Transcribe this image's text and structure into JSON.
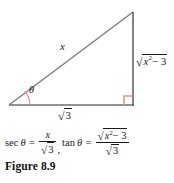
{
  "figure": {
    "caption": "Figure 8.9",
    "colors": {
      "line": "#5a5a5a",
      "hypotenuse": "#6b6b6b",
      "vertical_leg": "#4a4a4a",
      "angle_mark": "#e8908f",
      "right_angle_mark": "#e8908f",
      "text": "#1a1a1a",
      "background": "#ffffff"
    },
    "triangle": {
      "vertices": {
        "left": [
          9,
          105
        ],
        "apex": [
          133,
          12
        ],
        "right": [
          133,
          105
        ]
      },
      "angle_label": "θ",
      "hypotenuse_label": "x",
      "vertical_leg_label": {
        "radicand_base": "x",
        "radicand_exponent": "2",
        "radicand_rest": "− 3"
      },
      "base_label": {
        "radicand": "3"
      }
    }
  },
  "formula": {
    "sec": {
      "func": "sec",
      "theta": "θ",
      "equals": "=",
      "numerator": "x",
      "denominator_radicand": "3",
      "separator": ","
    },
    "tan": {
      "func": "tan",
      "theta": "θ",
      "equals": "=",
      "numerator_radicand_base": "x",
      "numerator_radicand_exponent": "2",
      "numerator_radicand_rest": "− 3",
      "denominator_radicand": "3"
    }
  }
}
